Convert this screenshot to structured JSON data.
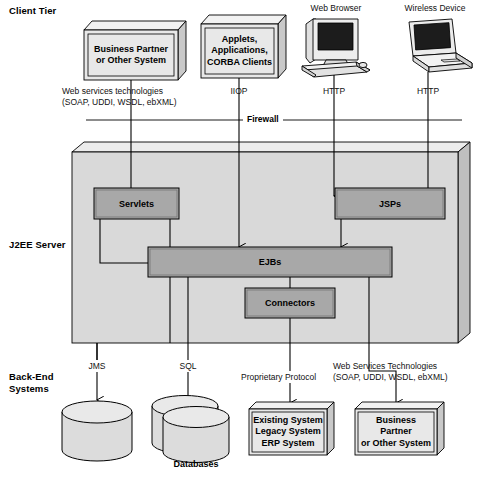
{
  "diagram": {
    "colors": {
      "box_fill": "#e8e8e8",
      "box_top": "#f2f2f2",
      "box_side": "#c9c9c9",
      "server_fill": "#d9d9d9",
      "server_top": "#ececec",
      "server_side": "#bfbfbf",
      "component_fill": "#a8a8a8",
      "cylinder_fill": "#dcdcdc",
      "line": "#000000"
    }
  },
  "tiers": [
    {
      "id": "client-tier",
      "label": "Client Tier"
    },
    {
      "id": "j2ee-server",
      "label": "J2EE Server"
    },
    {
      "id": "back-end-systems",
      "label": "Back-End\nSystems"
    }
  ],
  "client_tier": {
    "boxes": [
      {
        "id": "business-partner-client",
        "label": "Business Partner\nor Other System"
      },
      {
        "id": "applets-applications-corba",
        "label": "Applets,\nApplications,\nCORBA Clients"
      }
    ],
    "devices": [
      {
        "id": "web-browser",
        "label": "Web Browser",
        "icon": "desktop-computer-icon"
      },
      {
        "id": "wireless-device",
        "label": "Wireless Device",
        "icon": "laptop-icon"
      }
    ],
    "protocols": [
      {
        "id": "web-services-client",
        "label": "Web services technologies\n(SOAP, UDDI, WSDL, ebXML)"
      },
      {
        "id": "iiop",
        "label": "IIOP"
      },
      {
        "id": "http-browser",
        "label": "HTTP"
      },
      {
        "id": "http-wireless",
        "label": "HTTP"
      }
    ]
  },
  "firewall": {
    "label": "Firewall"
  },
  "server": {
    "components": [
      {
        "id": "servlets",
        "label": "Servlets"
      },
      {
        "id": "jsps",
        "label": "JSPs"
      },
      {
        "id": "ejbs",
        "label": "EJBs"
      },
      {
        "id": "connectors",
        "label": "Connectors"
      }
    ]
  },
  "backend": {
    "protocols": [
      {
        "id": "jms",
        "label": "JMS"
      },
      {
        "id": "sql",
        "label": "SQL"
      },
      {
        "id": "proprietary-protocol",
        "label": "Proprietary Protocol"
      },
      {
        "id": "web-services-backend",
        "label": "Web Services Technologies\n(SOAP, UDDI, WSDL, ebXML)"
      }
    ],
    "stores": [
      {
        "id": "message-queue",
        "label": "",
        "shape": "cylinder"
      },
      {
        "id": "databases",
        "label": "Databases",
        "shape": "double-cylinder"
      }
    ],
    "boxes": [
      {
        "id": "existing-legacy-erp",
        "label": "Existing System\nLegacy System\nERP System"
      },
      {
        "id": "business-partner-backend",
        "label": "Business\nPartner\nor Other System"
      }
    ]
  }
}
